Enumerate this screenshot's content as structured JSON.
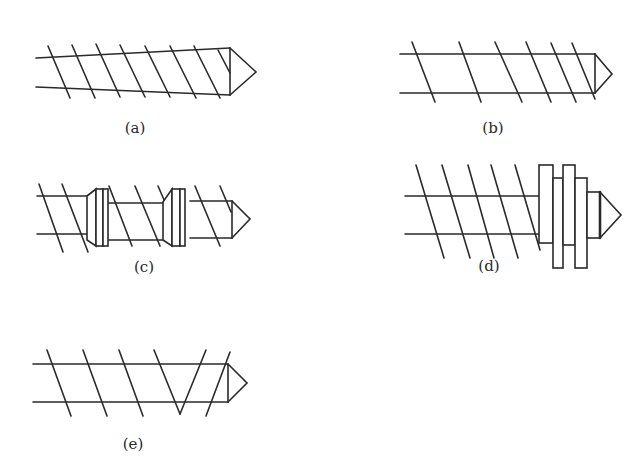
{
  "figure": {
    "panels": [
      {
        "id": "a",
        "label": "(a)",
        "description": "Tapered screw with conical tip and helical flights"
      },
      {
        "id": "b",
        "label": "(b)",
        "description": "Constant-diameter screw with decreasing flight pitch and conical tip"
      },
      {
        "id": "c",
        "label": "(c)",
        "description": "Screw with two barrier/blister rings and conical tip"
      },
      {
        "id": "d",
        "label": "(d)",
        "description": "Screw with stacked mixing discs before conical tip"
      },
      {
        "id": "e",
        "label": "(e)",
        "description": "Screw with a reversed/double flight section (V) near conical tip"
      }
    ]
  },
  "colors": {
    "stroke": "#2a2a2a",
    "background": "#ffffff"
  }
}
